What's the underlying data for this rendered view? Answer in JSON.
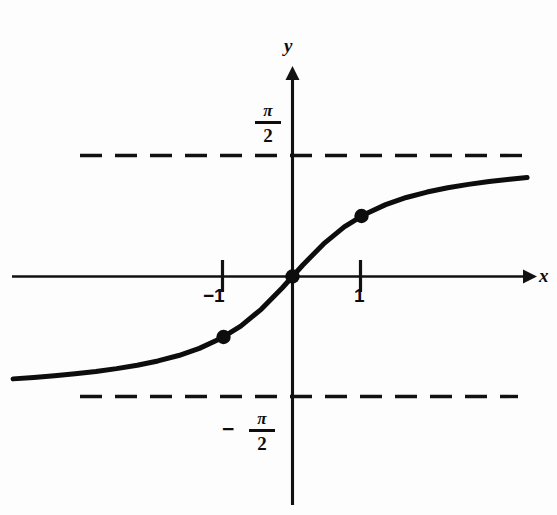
{
  "figure": {
    "background_color": "#fdfdfd",
    "ink_color": "#0d0d0d",
    "width": 557,
    "height": 515
  },
  "axes": {
    "x_axis_label": "x",
    "y_axis_label": "y",
    "x_tick_labels": [
      "−1",
      "1"
    ],
    "asymptote_upper_numerator": "π",
    "asymptote_upper_denominator": "2",
    "asymptote_lower_sign": "−",
    "asymptote_lower_numerator": "π",
    "asymptote_lower_denominator": "2"
  },
  "chart_data": {
    "type": "line",
    "title": "",
    "subtitle": "",
    "xlabel": "x",
    "ylabel": "y",
    "function": "y = arctan(x)",
    "xlim": [
      -4.05,
      3.5
    ],
    "ylim": [
      -1.85,
      1.85
    ],
    "grid": false,
    "legend": false,
    "legend_position": "none",
    "x_ticks": [
      -1,
      1
    ],
    "x_tick_labels": [
      "−1",
      "1"
    ],
    "y_ticks": [
      1.5707963,
      -1.5707963
    ],
    "y_tick_labels": [
      "π/2",
      "−π/2"
    ],
    "annotations": [
      {
        "text": "π/2",
        "type": "horizontal-asymptote-label",
        "y": 1.5707963
      },
      {
        "text": "−π/2",
        "type": "horizontal-asymptote-label",
        "y": -1.5707963
      }
    ],
    "asymptotes": [
      {
        "orientation": "horizontal",
        "y": 1.5707963,
        "style": "dashed",
        "label": "π/2"
      },
      {
        "orientation": "horizontal",
        "y": -1.5707963,
        "style": "dashed",
        "label": "−π/2"
      }
    ],
    "series": [
      {
        "name": "arctan(x)",
        "style": "solid",
        "color": "#0d0d0d",
        "linewidth": 5,
        "x": [
          -4.05,
          -3.75,
          -3.45,
          -3.15,
          -2.85,
          -2.55,
          -2.25,
          -1.95,
          -1.65,
          -1.35,
          -1.05,
          -0.75,
          -0.45,
          -0.15,
          0,
          0.15,
          0.45,
          0.75,
          1.05,
          1.35,
          1.65,
          1.95,
          2.25,
          2.55,
          2.85,
          3.15,
          3.4
        ],
        "y": [
          -1.329,
          -1.31,
          -1.289,
          -1.263,
          -1.233,
          -1.196,
          -1.152,
          -1.096,
          -1.026,
          -0.933,
          -0.809,
          -0.644,
          -0.423,
          -0.149,
          0,
          0.149,
          0.423,
          0.644,
          0.809,
          0.933,
          1.026,
          1.096,
          1.152,
          1.196,
          1.233,
          1.263,
          1.284
        ]
      }
    ],
    "points": [
      {
        "x": -1,
        "y": -0.7853982,
        "label": "(−1, −π/4)",
        "marker": "filled-circle"
      },
      {
        "x": 0,
        "y": 0,
        "label": "(0, 0)",
        "marker": "filled-circle"
      },
      {
        "x": 1,
        "y": 0.7853982,
        "label": "(1, π/4)",
        "marker": "filled-circle"
      }
    ]
  }
}
